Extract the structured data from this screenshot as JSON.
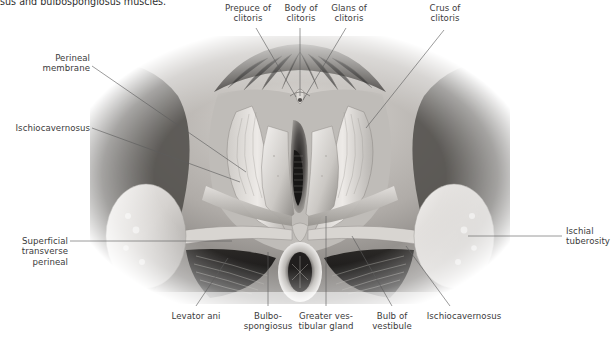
{
  "figure": {
    "kind": "anatomical-illustration",
    "style": "grayscale medical drawing",
    "background_color": "#ffffff",
    "text_color": "#3b3b3b",
    "leader_color": "#5d5d5d"
  },
  "caption": {
    "text": "sus and bulbospongiosus muscles.",
    "note": "clipped at top edge of screenshot"
  },
  "labels": {
    "prepuce_of_clitoris": "Prepuce of\nclitoris",
    "body_of_clitoris": "Body of\nclitoris",
    "glans_of_clitoris": "Glans of\nclitoris",
    "crus_of_clitoris": "Crus of\nclitoris",
    "perineal_membrane": "Perineal\nmembrane",
    "ischiocavernosus_left": "Ischiocavernosus",
    "superficial_transverse_perineal": "Superficial\ntransverse\nperineal",
    "ischial_tuberosity": "Ischial\ntuberosity",
    "levator_ani": "Levator ani",
    "bulbospongiosus": "Bulbo-\nspongiosus",
    "greater_vestibular_gland": "Greater ves-\ntibular gland",
    "bulb_of_vestibule": "Bulb of\nvestibule",
    "ischiocavernosus_right": "Ischiocavernosus"
  }
}
